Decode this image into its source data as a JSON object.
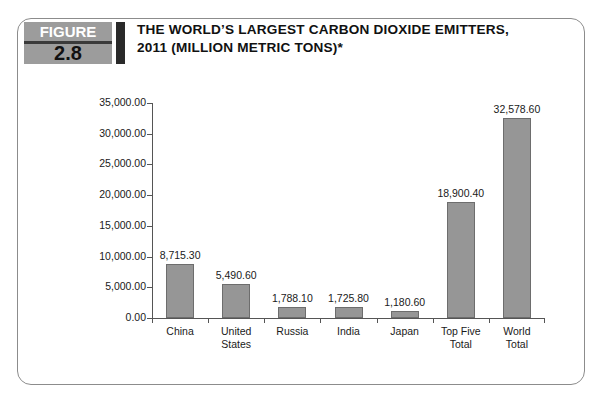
{
  "figure": {
    "badge_word": "FIGURE",
    "badge_number": "2.8",
    "title_line1": "THE WORLD’S LARGEST CARBON DIOXIDE EMITTERS,",
    "title_line2": "2011 (MILLION METRIC TONS)*"
  },
  "colors": {
    "bar_fill": "#969696",
    "bar_stroke": "#6d6d6d",
    "badge_gray": "#9c9c9c",
    "badge_dark": "#2a2a2a",
    "axis": "#555555",
    "text": "#1a1a1a",
    "frame": "#8c8c8c"
  },
  "chart_data": {
    "type": "bar",
    "title": "THE WORLD’S LARGEST CARBON DIOXIDE EMITTERS, 2011 (MILLION METRIC TONS)*",
    "xlabel": "",
    "ylabel": "",
    "grid": false,
    "legend": "none",
    "ylim": [
      0,
      35000
    ],
    "ytick_step": 5000,
    "ytick_labels": [
      "35,000.00",
      "30,000.00",
      "25,000.00",
      "20,000.00",
      "15,000.00",
      "10,000.00",
      "5,000.00",
      "0.00"
    ],
    "ytick_values": [
      35000,
      30000,
      25000,
      20000,
      15000,
      10000,
      5000,
      0
    ],
    "categories": [
      "China",
      "United States",
      "Russia",
      "India",
      "Japan",
      "Top Five Total",
      "World Total"
    ],
    "category_lines": [
      [
        "China"
      ],
      [
        "United",
        "States"
      ],
      [
        "Russia"
      ],
      [
        "India"
      ],
      [
        "Japan"
      ],
      [
        "Top Five",
        "Total"
      ],
      [
        "World",
        "Total"
      ]
    ],
    "values": [
      8715.3,
      5490.6,
      1788.1,
      1725.8,
      1180.6,
      18900.4,
      32578.6
    ],
    "value_labels": [
      "8,715.30",
      "5,490.60",
      "1,788.10",
      "1,725.80",
      "1,180.60",
      "18,900.40",
      "32,578.60"
    ]
  }
}
